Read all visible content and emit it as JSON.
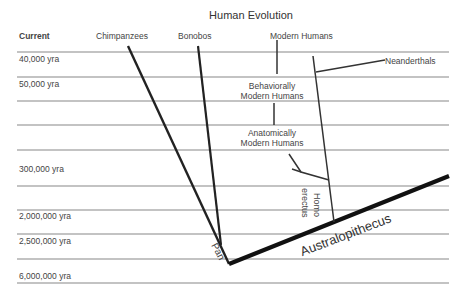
{
  "title": "Human Evolution",
  "time_labels": [
    {
      "text": "Current",
      "bold": true
    },
    {
      "text": "40,000 yra"
    },
    {
      "text": "50,000 yra"
    },
    {
      "text": "300,000 yra"
    },
    {
      "text": "2,000,000 yra"
    },
    {
      "text": "2,500,000 yra"
    },
    {
      "text": "6,000,000 yra"
    }
  ],
  "taxa": {
    "chimpanzees": "Chimpanzees",
    "bonobos": "Bonobos",
    "modern_humans": "Modern Humans",
    "neanderthals": "Neanderthals",
    "behaviorally_line1": "Behaviorally",
    "behaviorally_line2": "Modern Humans",
    "anatomically_line1": "Anatomically",
    "anatomically_line2": "Modern Humans",
    "homo": "Homo",
    "erectus": "erectus",
    "pan": "Pan",
    "australopithecus": "Australopithecus"
  },
  "colors": {
    "lines": "#777777",
    "branches": "#222222",
    "text": "#444444"
  }
}
